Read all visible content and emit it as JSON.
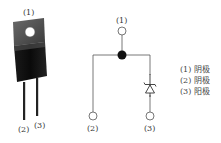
{
  "package": {
    "pin_labels": [
      "(1)",
      "(2)",
      "(3)"
    ]
  },
  "schematic": {
    "pin_labels": [
      "(1)",
      "(2)",
      "(3)"
    ]
  },
  "legend": [
    {
      "pin": "(1)",
      "name": "阴极"
    },
    {
      "pin": "(2)",
      "name": "阴极"
    },
    {
      "pin": "(3)",
      "name": "阳极"
    }
  ]
}
